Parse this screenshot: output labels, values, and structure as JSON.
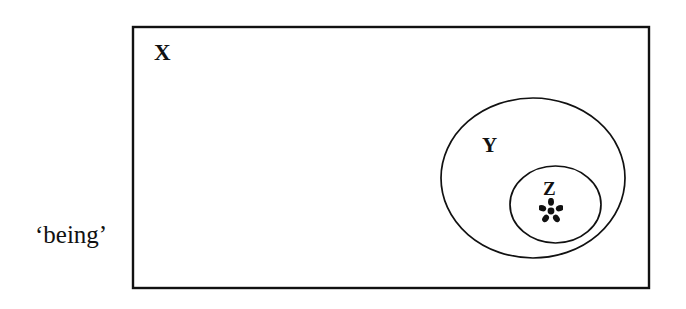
{
  "figure": {
    "background_color": "#ffffff",
    "stroke_color": "#111111",
    "caption": "‘being’",
    "sets": {
      "outer": {
        "label": "X",
        "shape": "rectangle"
      },
      "middle": {
        "label": "Y",
        "shape": "ellipse"
      },
      "inner": {
        "label": "Z",
        "shape": "ellipse"
      }
    },
    "marker": {
      "name": "asterisk-marker",
      "glyph": "*"
    }
  }
}
